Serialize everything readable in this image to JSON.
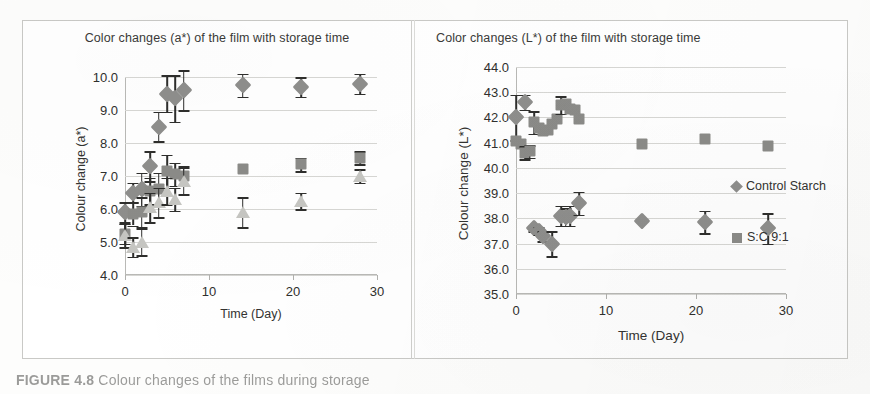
{
  "figure": {
    "caption_prefix": "FIGURE 4.8",
    "caption_rest": "Colour changes of the films during storage",
    "divider": "panel-divider"
  },
  "legend": {
    "position": "right",
    "entries": [
      {
        "label": "Control Starch",
        "marker": "diamond",
        "color": "#8e8e8c"
      },
      {
        "label": "S:C 9:1",
        "marker": "square",
        "color": "#8b8b88"
      }
    ]
  },
  "chart_data": [
    {
      "id": "chart-a",
      "type": "scatter",
      "title": "Color changes (a*) of the film with storage time",
      "xlabel": "Time (Day)",
      "ylabel": "Colour change (a*)",
      "xlim": [
        0,
        30
      ],
      "ylim": [
        4.0,
        10.0
      ],
      "xticks": [
        "0",
        "10",
        "20",
        "30"
      ],
      "xtick_values": [
        0,
        10,
        20,
        30
      ],
      "yticks": [
        "4.0",
        "5.0",
        "6.0",
        "7.0",
        "8.0",
        "9.0",
        "10.0"
      ],
      "ytick_values": [
        4.0,
        5.0,
        6.0,
        7.0,
        8.0,
        9.0,
        10.0
      ],
      "grid": true,
      "series": [
        {
          "name": "Control Starch",
          "marker": "diamond",
          "color": "#8e8e8c",
          "x": [
            0,
            1,
            2,
            3,
            4,
            5,
            6,
            7,
            14,
            21,
            28
          ],
          "y": [
            5.9,
            6.5,
            6.6,
            7.3,
            8.5,
            9.5,
            9.35,
            9.6,
            9.75,
            9.7,
            9.8
          ],
          "yerr": [
            0.3,
            0.3,
            0.5,
            0.45,
            0.45,
            0.55,
            0.7,
            0.6,
            0.35,
            0.3,
            0.3
          ]
        },
        {
          "name": "S:C 9:1",
          "marker": "square",
          "color": "#8b8b88",
          "x": [
            0,
            1,
            2,
            3,
            4,
            5,
            6,
            7,
            14,
            21,
            28
          ],
          "y": [
            5.25,
            5.85,
            5.9,
            6.55,
            6.6,
            7.15,
            7.05,
            7.0,
            7.2,
            7.35,
            7.55
          ],
          "yerr": [
            0.3,
            0.35,
            0.45,
            0.4,
            0.5,
            0.5,
            0.35,
            0.3,
            0.0,
            0.2,
            0.2
          ]
        },
        {
          "name": "Third film",
          "marker": "triangle",
          "color": "#c6c6c2",
          "x": [
            0,
            1,
            2,
            3,
            4,
            5,
            6,
            7,
            14,
            21,
            28
          ],
          "y": [
            5.2,
            4.85,
            5.0,
            6.05,
            6.2,
            6.55,
            6.3,
            6.85,
            5.9,
            6.25,
            7.0
          ],
          "yerr": [
            0.35,
            0.3,
            0.4,
            0.45,
            0.45,
            0.4,
            0.35,
            0.4,
            0.45,
            0.25,
            0.2
          ]
        }
      ]
    },
    {
      "id": "chart-l",
      "type": "scatter",
      "title": "Color changes (L*) of the film with storage time",
      "xlabel": "Time (Day)",
      "ylabel": "Colour change (L*)",
      "xlim": [
        0,
        30
      ],
      "ylim": [
        35.0,
        44.0
      ],
      "xticks": [
        "0",
        "10",
        "20",
        "30"
      ],
      "xtick_values": [
        0,
        10,
        20,
        30
      ],
      "yticks": [
        "35.0",
        "36.0",
        "37.0",
        "38.0",
        "39.0",
        "40.0",
        "41.0",
        "42.0",
        "43.0",
        "44.0"
      ],
      "ytick_values": [
        35.0,
        36.0,
        37.0,
        38.0,
        39.0,
        40.0,
        41.0,
        42.0,
        43.0,
        44.0
      ],
      "grid": true,
      "series": [
        {
          "name": "Control Starch",
          "marker": "diamond",
          "color": "#8e8e8c",
          "x": [
            0,
            1,
            2,
            2.5,
            3,
            4,
            5,
            5.5,
            6,
            7,
            14,
            21,
            28
          ],
          "y": [
            42.0,
            42.6,
            37.6,
            37.5,
            37.3,
            37.0,
            38.1,
            38.05,
            38.1,
            38.6,
            37.9,
            37.85,
            37.6
          ],
          "yerr": [
            0.9,
            0.3,
            0.1,
            0.15,
            0.2,
            0.5,
            0.4,
            0.35,
            0.4,
            0.45,
            0.0,
            0.45,
            0.6
          ]
        },
        {
          "name": "S:C 9:1",
          "marker": "square",
          "color": "#8b8b88",
          "x": [
            0,
            0.5,
            1,
            1.5,
            2,
            2.5,
            3,
            3.5,
            4,
            4.5,
            5,
            5.5,
            6,
            6.5,
            7,
            14,
            21,
            28
          ],
          "y": [
            41.05,
            40.95,
            40.6,
            40.65,
            41.8,
            41.6,
            41.45,
            41.5,
            41.75,
            41.95,
            42.5,
            42.55,
            42.35,
            42.3,
            41.95,
            40.95,
            41.15,
            40.85
          ],
          "yerr": [
            0.0,
            0.0,
            0.25,
            0.25,
            0.45,
            0.0,
            0.0,
            0.0,
            0.0,
            0.0,
            0.35,
            0.0,
            0.0,
            0.0,
            0.0,
            0.0,
            0.0,
            0.0
          ]
        }
      ]
    }
  ]
}
